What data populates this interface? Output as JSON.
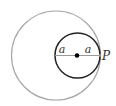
{
  "diagram": {
    "outer_circle": {
      "cx": 56,
      "cy": 55.5,
      "r": 44.5,
      "stroke": "#a9a9a9"
    },
    "inner_circle": {
      "cx": 77.5,
      "cy": 55.5,
      "r": 22.5,
      "stroke": "#222222"
    },
    "diameter_line": {
      "x1": 55,
      "x2": 100,
      "y": 55.5,
      "stroke": "#9a9a9a"
    },
    "center_dot": {
      "cx": 77,
      "cy": 55.5,
      "r": 2.3,
      "fill": "#000000"
    },
    "labels": {
      "left_radius": "a",
      "right_radius": "a",
      "point": "P"
    }
  }
}
